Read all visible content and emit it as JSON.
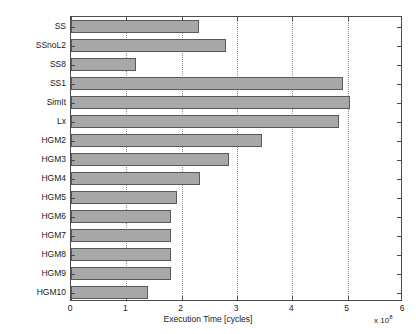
{
  "chart_data": {
    "type": "bar",
    "orientation": "horizontal",
    "title": "",
    "xlabel": "Execution Time [cycles]",
    "ylabel": "",
    "x_multiplier": "x 10",
    "x_exponent": "8",
    "xlim": [
      0,
      6
    ],
    "ylim_categories": 15,
    "grid": "vertical-dotted",
    "legend": "none",
    "bar_color": "#a8a8a8",
    "bar_edge_color": "#5a5a5a",
    "xticks": [
      "0",
      "1",
      "2",
      "3",
      "4",
      "5",
      "6"
    ],
    "categories": [
      "SS",
      "SSnoL2",
      "SS8",
      "SS1",
      "SimIt",
      "Lx",
      "HGM2",
      "HGM3",
      "HGM4",
      "HGM5",
      "HGM6",
      "HGM7",
      "HGM8",
      "HGM9",
      "HGM10"
    ],
    "values": [
      2.32,
      2.81,
      1.18,
      4.92,
      5.05,
      4.85,
      3.45,
      2.86,
      2.34,
      1.92,
      1.81,
      1.81,
      1.81,
      1.81,
      1.39
    ]
  }
}
